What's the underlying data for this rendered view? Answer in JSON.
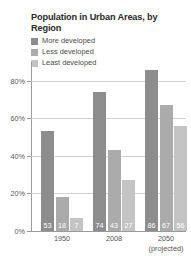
{
  "chart_data": {
    "type": "bar",
    "title": "Population in Urban Areas, by Region",
    "xlabel": "",
    "ylabel": "",
    "ylim": [
      0,
      90
    ],
    "grid": true,
    "legend_position": "top-left",
    "categories": [
      "1950",
      "2008",
      "2050 (projected)"
    ],
    "category_lines": [
      {
        "main": "1950",
        "sub": ""
      },
      {
        "main": "2008",
        "sub": ""
      },
      {
        "main": "2050",
        "sub": "(projected)"
      }
    ],
    "yticks": [
      0,
      20,
      40,
      60,
      80
    ],
    "ytick_labels": [
      "0%",
      "20%",
      "40%",
      "60%",
      "80%"
    ],
    "series": [
      {
        "name": "More developed",
        "values": [
          53,
          74,
          86
        ],
        "color": "#8d8d8d"
      },
      {
        "name": "Less developed",
        "values": [
          18,
          43,
          67
        ],
        "color": "#ababab"
      },
      {
        "name": "Least developed",
        "values": [
          7,
          27,
          56
        ],
        "color": "#c4c4c4"
      }
    ],
    "value_labels": [
      [
        "53",
        "18",
        "7"
      ],
      [
        "74",
        "43",
        "27"
      ],
      [
        "86",
        "67",
        "56"
      ]
    ]
  },
  "legend": {
    "items": [
      {
        "label": "More developed",
        "color": "#8d8d8d"
      },
      {
        "label": "Less developed",
        "color": "#ababab"
      },
      {
        "label": "Least developed",
        "color": "#c4c4c4"
      }
    ]
  },
  "colors": {
    "more_developed": "#8d8d8d",
    "less_developed": "#ababab",
    "least_developed": "#c4c4c4",
    "axis": "#9a9a9a",
    "grid": "#d2d2d2",
    "text": "#565656",
    "title": "#2b2b2b",
    "background": "#ffffff"
  }
}
